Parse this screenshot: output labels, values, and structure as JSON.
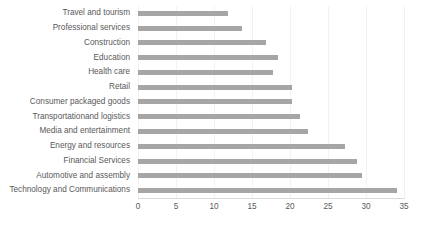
{
  "chart_data": {
    "type": "bar",
    "orientation": "horizontal",
    "title": "",
    "xlabel": "",
    "ylabel": "",
    "xlim": [
      0,
      35
    ],
    "xticks": [
      0,
      5,
      10,
      15,
      20,
      25,
      30,
      35
    ],
    "grid": true,
    "legend": false,
    "bar_color": "#a6a6a6",
    "categories": [
      "Travel and tourism",
      "Professional services",
      "Construction",
      "Education",
      "Health care",
      "Retail",
      "Consumer packaged goods",
      "Transportationand logistics",
      "Media and entertainment",
      "Energy and resources",
      "Financial Services",
      "Automotive and assembly",
      "Technology and Communications"
    ],
    "values": [
      11.8,
      13.7,
      16.8,
      18.4,
      17.8,
      20.3,
      20.3,
      21.3,
      22.4,
      27.3,
      28.8,
      29.5,
      34.1
    ]
  },
  "caption": {
    "text": ""
  }
}
